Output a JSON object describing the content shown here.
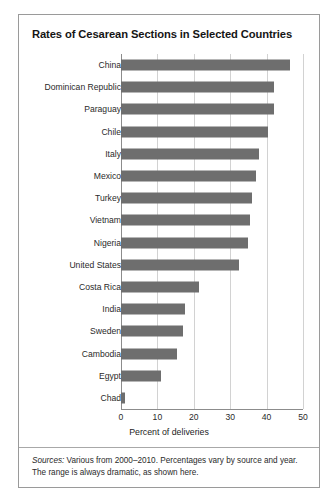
{
  "chart_data": {
    "type": "bar",
    "orientation": "horizontal",
    "title": "Rates of Cesarean Sections in Selected Countries",
    "xlabel": "Percent of deliveries",
    "ylabel": "",
    "xlim": [
      0,
      50
    ],
    "xticks": [
      0,
      10,
      20,
      30,
      40,
      50
    ],
    "grid": true,
    "legend": null,
    "bar_color": "#6e6e6e",
    "categories": [
      "China",
      "Dominican Republic",
      "Paraguay",
      "Chile",
      "Italy",
      "Mexico",
      "Turkey",
      "Vietnam",
      "Nigeria",
      "United States",
      "Costa Rica",
      "India",
      "Sweden",
      "Cambodia",
      "Egypt",
      "Chad"
    ],
    "values": [
      46.5,
      42,
      42,
      40.5,
      38,
      37,
      36,
      35.5,
      35,
      32.5,
      21.5,
      17.5,
      17,
      15.5,
      11,
      1
    ]
  },
  "figure": {
    "title": "Rates of Cesarean Sections in Selected Countries",
    "xlabel": "Percent of deliveries",
    "source_label": "Sources:",
    "source_text": " Various from 2000–2010. Percentages vary by source and year. The range is always dramatic, as shown here."
  }
}
